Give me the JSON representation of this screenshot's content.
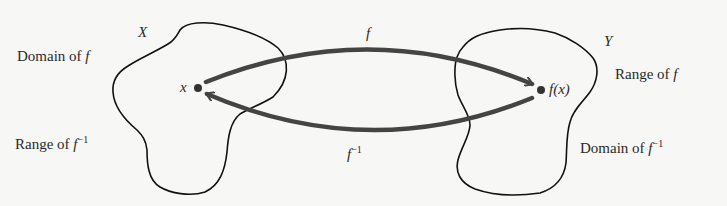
{
  "diagram": {
    "sets": {
      "left": {
        "name": "X",
        "label_top": "Domain of ",
        "label_top_fn": "f",
        "label_bottom": "Range of ",
        "label_bottom_fn": "f",
        "label_bottom_sup": "−1"
      },
      "right": {
        "name": "Y",
        "label_top": "Range of ",
        "label_top_fn": "f",
        "label_bottom": "Domain of ",
        "label_bottom_fn": "f",
        "label_bottom_sup": "−1"
      }
    },
    "points": {
      "x": {
        "label": "x"
      },
      "fx": {
        "label_f": "f",
        "label_rest": "(x)"
      }
    },
    "arrows": {
      "forward": {
        "label": "f"
      },
      "inverse": {
        "label": "f",
        "sup": "−1"
      }
    },
    "colors": {
      "arrow": "#444444",
      "outline": "#111111",
      "text": "#2a2a2a",
      "background": "#f7f7f5"
    }
  }
}
